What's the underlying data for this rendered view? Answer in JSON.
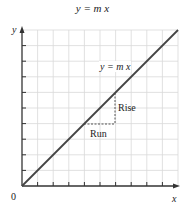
{
  "title": "y = m x",
  "line_label": "y = m x",
  "rise_label": "Rise",
  "run_label": "Run",
  "axes": {
    "x_label": "x",
    "y_label": "y",
    "origin_label": "0"
  },
  "grid": {
    "columns": 10,
    "rows": 10
  },
  "colors": {
    "grid": "#d9d9d9",
    "axis": "#333333",
    "line": "#444444",
    "dash": "#444444"
  }
}
